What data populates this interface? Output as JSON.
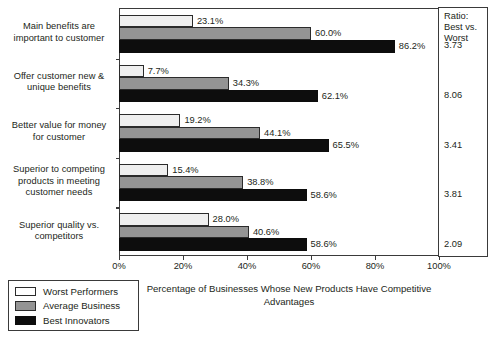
{
  "chart_data": {
    "type": "bar",
    "orientation": "horizontal",
    "title": "",
    "xlabel": "Percentage of Businesses Whose New Products Have Competitive Advantages",
    "ylabel": "",
    "xlim": [
      0,
      100
    ],
    "xticks": [
      "0%",
      "20%",
      "40%",
      "60%",
      "80%",
      "100%"
    ],
    "xtick_values": [
      0,
      20,
      40,
      60,
      80,
      100
    ],
    "grid": false,
    "legend_position": "bottom-left",
    "categories": [
      "Main benefits are important to customer",
      "Offer customer new & unique benefits",
      "Better value for money for customer",
      "Superior to competing products in meeting customer needs",
      "Superior quality vs. competitors"
    ],
    "category_lines": [
      [
        "Main benefits are",
        "important to customer"
      ],
      [
        "Offer customer new &",
        "unique benefits"
      ],
      [
        "Better value for money",
        "for customer"
      ],
      [
        "Superior to competing",
        "products in meeting",
        "customer needs"
      ],
      [
        "Superior quality vs.",
        "competitors"
      ]
    ],
    "series": [
      {
        "name": "Worst Performers",
        "color": "#efefef",
        "values": [
          23.1,
          7.7,
          19.2,
          15.4,
          28.0
        ],
        "labels": [
          "23.1%",
          "7.7%",
          "19.2%",
          "15.4%",
          "28.0%"
        ]
      },
      {
        "name": "Average Business",
        "color": "#949494",
        "values": [
          60.0,
          34.3,
          44.1,
          38.8,
          40.6
        ],
        "labels": [
          "60.0%",
          "34.3%",
          "44.1%",
          "38.8%",
          "40.6%"
        ]
      },
      {
        "name": "Best Innovators",
        "color": "#0d0d0d",
        "values": [
          86.2,
          62.1,
          65.5,
          58.6,
          58.6
        ],
        "labels": [
          "86.2%",
          "62.1%",
          "65.5%",
          "58.6%",
          "58.6%"
        ]
      }
    ],
    "ratio_column": {
      "header_lines": [
        "Ratio:",
        "Best vs.",
        "Worst"
      ],
      "values": [
        "3.73",
        "8.06",
        "3.41",
        "3.81",
        "2.09"
      ]
    }
  },
  "xaxis_title_lines": [
    "Percentage of Businesses Whose New Products Have Competitive",
    "Advantages"
  ],
  "legend": {
    "items": [
      {
        "label": "Worst Performers"
      },
      {
        "label": "Average Business"
      },
      {
        "label": "Best Innovators"
      }
    ]
  }
}
